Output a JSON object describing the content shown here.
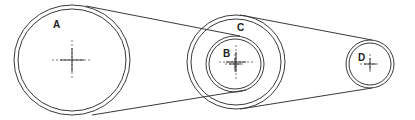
{
  "diagram": {
    "type": "belt-pulley-system",
    "pulleys": [
      {
        "label": "A",
        "cx": 72,
        "cy": 60,
        "r_outer_x": 58,
        "r_outer_y": 55,
        "ring_gap": 4,
        "label_x": 53,
        "label_y": 28
      },
      {
        "label": "C",
        "cx": 236,
        "cy": 62,
        "r_outer_x": 49,
        "r_outer_y": 47,
        "ring_gap": 4,
        "label_x": 237,
        "label_y": 31
      },
      {
        "label": "B",
        "cx": 235,
        "cy": 64,
        "r_outer_x": 29,
        "r_outer_y": 28,
        "ring_gap": 3,
        "label_x": 223,
        "label_y": 57
      },
      {
        "label": "D",
        "cx": 370,
        "cy": 64,
        "r_outer_x": 24,
        "r_outer_y": 24,
        "ring_gap": 3,
        "label_x": 358,
        "label_y": 61
      }
    ],
    "belts": [
      {
        "name": "A-B upper",
        "x1": 86,
        "y1": 6,
        "x2": 240,
        "y2": 36
      },
      {
        "name": "A-B lower",
        "x1": 92,
        "y1": 115,
        "x2": 246,
        "y2": 90
      },
      {
        "name": "C-D upper",
        "x1": 240,
        "y1": 15,
        "x2": 372,
        "y2": 40
      },
      {
        "name": "C-D lower",
        "x1": 240,
        "y1": 109,
        "x2": 372,
        "y2": 88
      }
    ],
    "colors": {
      "line": "#3a3a3a",
      "background": "#ffffff"
    }
  }
}
